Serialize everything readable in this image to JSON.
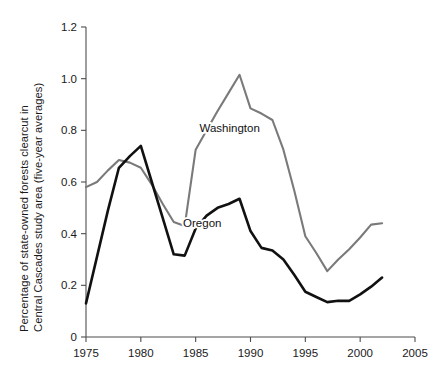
{
  "chart_data": {
    "type": "line",
    "title": "",
    "subtitle": "",
    "xlabel": "",
    "ylabel": "Percentage of state-owned forests clearcut in Central Cascades study area (five-year averages)",
    "ylabel_line1": "Percentage of state-owned forests clearcut in",
    "ylabel_line2": "Central Cascades study area (five-year averages)",
    "xlim": [
      1975,
      2005
    ],
    "ylim": [
      0,
      1.2
    ],
    "xticks": [
      1975,
      1980,
      1985,
      1990,
      1995,
      2000,
      2005
    ],
    "xtick_labels": [
      "1975",
      "1980",
      "1985",
      "1990",
      "1995",
      "2000",
      "2005"
    ],
    "yticks": [
      0,
      0.2,
      0.4,
      0.6,
      0.8,
      1.0,
      1.2
    ],
    "ytick_labels": [
      "0",
      "0.2",
      "0.4",
      "0.6",
      "0.8",
      "1.0",
      "1.2"
    ],
    "grid": false,
    "legend_position": "inline-annotations",
    "series": [
      {
        "name": "Washington",
        "color": "#7a7a7a",
        "label_x": 1988.1,
        "label_y": 0.795,
        "points": [
          [
            1975,
            0.58
          ],
          [
            1976,
            0.6
          ],
          [
            1977,
            0.645
          ],
          [
            1978,
            0.685
          ],
          [
            1979,
            0.675
          ],
          [
            1980,
            0.655
          ],
          [
            1981,
            0.59
          ],
          [
            1982,
            0.515
          ],
          [
            1983,
            0.445
          ],
          [
            1984,
            0.43
          ],
          [
            1985,
            0.725
          ],
          [
            1986,
            0.8
          ],
          [
            1987,
            0.875
          ],
          [
            1988,
            0.945
          ],
          [
            1989,
            1.015
          ],
          [
            1990,
            0.885
          ],
          [
            1991,
            0.865
          ],
          [
            1992,
            0.84
          ],
          [
            1993,
            0.725
          ],
          [
            1994,
            0.565
          ],
          [
            1995,
            0.39
          ],
          [
            1996,
            0.325
          ],
          [
            1997,
            0.255
          ],
          [
            1998,
            0.3
          ],
          [
            1999,
            0.34
          ],
          [
            2000,
            0.385
          ],
          [
            2001,
            0.435
          ],
          [
            2002,
            0.44
          ]
        ]
      },
      {
        "name": "Oregon",
        "color": "#111111",
        "label_x": 1985.6,
        "label_y": 0.425,
        "points": [
          [
            1975,
            0.13
          ],
          [
            1976,
            0.31
          ],
          [
            1977,
            0.49
          ],
          [
            1978,
            0.655
          ],
          [
            1979,
            0.7
          ],
          [
            1980,
            0.74
          ],
          [
            1981,
            0.6
          ],
          [
            1982,
            0.46
          ],
          [
            1983,
            0.32
          ],
          [
            1984,
            0.315
          ],
          [
            1985,
            0.42
          ],
          [
            1986,
            0.47
          ],
          [
            1987,
            0.5
          ],
          [
            1988,
            0.515
          ],
          [
            1989,
            0.535
          ],
          [
            1990,
            0.41
          ],
          [
            1991,
            0.345
          ],
          [
            1992,
            0.335
          ],
          [
            1993,
            0.3
          ],
          [
            1994,
            0.24
          ],
          [
            1995,
            0.175
          ],
          [
            1996,
            0.155
          ],
          [
            1997,
            0.135
          ],
          [
            1998,
            0.14
          ],
          [
            1999,
            0.14
          ],
          [
            2000,
            0.165
          ],
          [
            2001,
            0.195
          ],
          [
            2002,
            0.23
          ]
        ]
      }
    ]
  },
  "axis": {
    "color": "#4d4d4d"
  }
}
